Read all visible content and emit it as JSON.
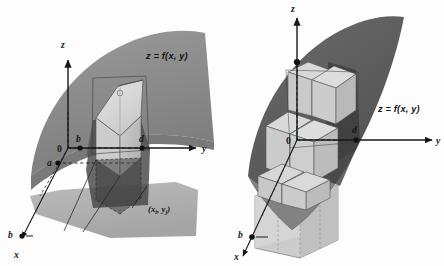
{
  "figure": {
    "kind": "math-diagram",
    "background_color": "#fdfdfd",
    "ink_color": "#17181a",
    "panels": [
      {
        "id": "left-panel",
        "name": "single-prism-panel",
        "surface_equation_label": "z = f(x, y)",
        "axes": [
          {
            "name": "z-axis",
            "label": "z",
            "direction": "up"
          },
          {
            "name": "y-axis",
            "label": "y",
            "direction": "right"
          },
          {
            "name": "x-axis",
            "label": "x",
            "direction": "down-left"
          }
        ],
        "point_labels": [
          {
            "name": "origin-label",
            "text": "0"
          },
          {
            "name": "b-on-y-axis-label",
            "text": "b"
          },
          {
            "name": "d-on-y-axis-label",
            "text": "d"
          },
          {
            "name": "a-label",
            "text": "a"
          },
          {
            "name": "b-on-x-axis-label",
            "text": "b"
          }
        ],
        "annotation": {
          "name": "sample-point-label",
          "text": "(x",
          "sub1": "i",
          "mid": ", y",
          "sub2": "j",
          "close": ")"
        },
        "surface_shades": {
          "surface_upper": "#8e8e8e",
          "surface_lower_shadow": "#6f6f6f",
          "surface_dark_patch": "#4a4a4a",
          "base_region": "#a9a9a9",
          "prism_light_face": "#dcdcdc",
          "prism_mid_face": "#c3c3c3",
          "prism_top_face": "#cfcfcf"
        }
      },
      {
        "id": "right-panel",
        "name": "multiple-prisms-panel",
        "surface_equation_label": "z = f(x, y)",
        "axes": [
          {
            "name": "z-axis",
            "label": "z",
            "direction": "up"
          },
          {
            "name": "y-axis",
            "label": "y",
            "direction": "right"
          },
          {
            "name": "x-axis",
            "label": "x",
            "direction": "down-left"
          }
        ],
        "point_labels": [
          {
            "name": "origin-label",
            "text": "0"
          },
          {
            "name": "d-on-y-axis-label",
            "text": "d"
          },
          {
            "name": "b-on-x-axis-label",
            "text": "b"
          }
        ],
        "surface_shades": {
          "surface_upper": "#5f5f5f",
          "surface_lower_shadow": "#7e7e7e",
          "surface_dark_patch": "#3f3f3f",
          "base_region": "#b3b3b3",
          "prism_light_face": "#d9d9d9",
          "prism_mid_face": "#bdbdbd",
          "prism_top_face": "#cbcbcb"
        }
      }
    ]
  }
}
